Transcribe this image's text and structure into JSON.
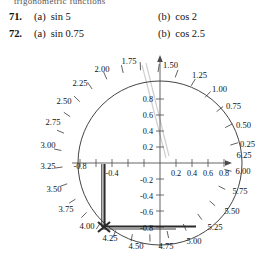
{
  "page": {
    "cropped_header_text": "trigonometric functions"
  },
  "exercises": [
    {
      "number": "71.",
      "part_a_label": "(a)",
      "part_a_text": "sin 5",
      "part_b_label": "(b)",
      "part_b_text": "cos 2"
    },
    {
      "number": "72.",
      "part_a_label": "(a)",
      "part_a_text": "sin 0.75",
      "part_b_label": "(b)",
      "part_b_text": "cos 2.5"
    }
  ],
  "figure": {
    "name": "unit-circle-radian-dial",
    "radian_labels": [
      "0.25",
      "0.50",
      "0.75",
      "1.00",
      "1.25",
      "1.50",
      "1.75",
      "2.00",
      "2.25",
      "2.50",
      "2.75",
      "3.00",
      "3.25",
      "3.50",
      "3.75",
      "4.00",
      "4.25",
      "4.50",
      "4.75",
      "5.00",
      "5.25",
      "5.50",
      "5.75",
      "6.00",
      "6.25"
    ],
    "x_axis_labels_negative": [
      "-0.8",
      "-0.4"
    ],
    "x_axis_labels_positive": [
      "0.2",
      "0.4",
      "0.6",
      "0.8"
    ],
    "y_axis_labels_positive": [
      "0.2",
      "0.4",
      "0.6",
      "0.8"
    ],
    "y_axis_labels_negative": [
      "-0.2",
      "-0.4",
      "-0.6",
      "-0.8"
    ],
    "marked_angle": "4.00",
    "colors": {
      "axis": "#4a4a4a",
      "circle": "#3a3a3a",
      "trace": "#2b2b2b",
      "ghost": "#cfcfcf"
    }
  }
}
